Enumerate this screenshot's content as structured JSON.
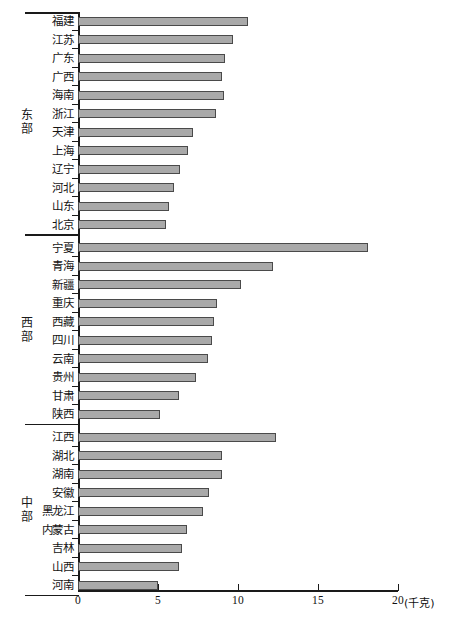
{
  "chart_data": {
    "type": "bar",
    "orientation": "horizontal",
    "title": "",
    "xlabel": "",
    "ylabel": "",
    "unit_label": "(千克)",
    "xlim": [
      0,
      20
    ],
    "xticks": [
      0,
      5,
      10,
      15,
      20
    ],
    "xtick_labels": [
      "0",
      "5",
      "10",
      "15",
      "20"
    ],
    "grid": false,
    "legend": "none",
    "bar_color": "#a9a9a9",
    "bar_edge_color": "#4a4a4a",
    "axis_color": "#1a1a1a",
    "groups": [
      {
        "name": "东部",
        "categories": [
          "福建",
          "江苏",
          "广东",
          "广西",
          "海南",
          "浙江",
          "天津",
          "上海",
          "辽宁",
          "河北",
          "山东",
          "北京"
        ],
        "values": [
          10.6,
          9.7,
          9.2,
          9.0,
          9.1,
          8.6,
          7.2,
          6.9,
          6.4,
          6.0,
          5.7,
          5.5,
          4.3
        ]
      },
      {
        "name": "西部",
        "categories": [
          "宁夏",
          "青海",
          "新疆",
          "重庆",
          "西藏",
          "四川",
          "云南",
          "贵州",
          "甘肃",
          "陕西"
        ],
        "values": [
          18.1,
          12.2,
          10.2,
          8.7,
          8.5,
          8.4,
          8.1,
          7.4,
          6.3,
          5.1
        ]
      },
      {
        "name": "中部",
        "categories": [
          "江西",
          "湖北",
          "湖南",
          "安徽",
          "黑龙江",
          "内蒙古",
          "吉林",
          "山西",
          "河南"
        ],
        "values": [
          12.4,
          9.0,
          9.0,
          8.2,
          7.8,
          6.8,
          6.5,
          6.3,
          5.0
        ]
      }
    ],
    "rows": [
      {
        "group": "东部",
        "category": "福建",
        "value": 10.6
      },
      {
        "group": "东部",
        "category": "江苏",
        "value": 9.7
      },
      {
        "group": "东部",
        "category": "广东",
        "value": 9.2
      },
      {
        "group": "东部",
        "category": "广西",
        "value": 9.0
      },
      {
        "group": "东部",
        "category": "海南",
        "value": 9.1
      },
      {
        "group": "东部",
        "category": "浙江",
        "value": 8.6
      },
      {
        "group": "东部",
        "category": "天津",
        "value": 6.9
      },
      {
        "group": "东部",
        "category": "上海",
        "value": 6.4
      },
      {
        "group": "东部",
        "category": "辽宁",
        "value": 6.0
      },
      {
        "group": "东部",
        "category": "河北",
        "value": 5.7
      },
      {
        "group": "东部",
        "category": "山东",
        "value": 5.5
      },
      {
        "group": "东部",
        "category": "北京",
        "value": 4.3
      },
      {
        "group": "西部",
        "category": "宁夏",
        "value": 18.1
      },
      {
        "group": "西部",
        "category": "青海",
        "value": 12.2
      },
      {
        "group": "西部",
        "category": "新疆",
        "value": 10.2
      },
      {
        "group": "西部",
        "category": "重庆",
        "value": 8.7
      },
      {
        "group": "西部",
        "category": "西藏",
        "value": 8.5
      },
      {
        "group": "西部",
        "category": "四川",
        "value": 8.4
      },
      {
        "group": "西部",
        "category": "云南",
        "value": 8.1
      },
      {
        "group": "西部",
        "category": "贵州",
        "value": 7.4
      },
      {
        "group": "西部",
        "category": "甘肃",
        "value": 6.3
      },
      {
        "group": "西部",
        "category": "陕西",
        "value": 5.1
      },
      {
        "group": "中部",
        "category": "江西",
        "value": 12.4
      },
      {
        "group": "中部",
        "category": "湖北",
        "value": 9.0
      },
      {
        "group": "中部",
        "category": "湖南",
        "value": 9.0
      },
      {
        "group": "中部",
        "category": "安徽",
        "value": 8.2
      },
      {
        "group": "中部",
        "category": "黑龙江",
        "value": 7.8
      },
      {
        "group": "中部",
        "category": "内蒙古",
        "value": 6.8
      },
      {
        "group": "中部",
        "category": "吉林",
        "value": 6.5
      },
      {
        "group": "中部",
        "category": "山西",
        "value": 6.3
      },
      {
        "group": "中部",
        "category": "河南",
        "value": 5.0
      }
    ]
  }
}
